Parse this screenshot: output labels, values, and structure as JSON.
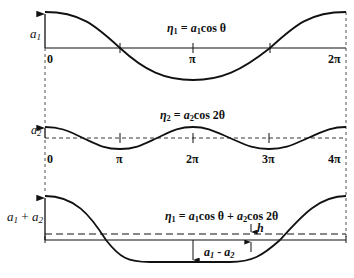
{
  "figure": {
    "stroke_color": "#111111",
    "background": "#ffffff"
  },
  "panels": [
    {
      "id": "panel-1",
      "equation": "η₁ = a₁cos θ",
      "eq_parts": {
        "eta": "η",
        "eta_sub": "1",
        "eq": " = ",
        "a": "a",
        "a_sub": "1",
        "rest": "cos θ"
      },
      "amplitude_label": {
        "a": "a",
        "sub": "1"
      },
      "x_ticks": [
        "0",
        "π",
        "2π"
      ]
    },
    {
      "id": "panel-2",
      "equation": "η₂ = a₂cos 2θ",
      "eq_parts": {
        "eta": "η",
        "eta_sub": "2",
        "eq": " = ",
        "a": "a",
        "a_sub": "2",
        "rest": "cos 2θ"
      },
      "amplitude_label": {
        "a": "a",
        "sub": "2"
      },
      "x_ticks": [
        "0",
        "π",
        "2π",
        "3π",
        "4π"
      ]
    },
    {
      "id": "panel-3",
      "equation": "η₁ = a₁cos θ + a₂cos 2θ",
      "eq_parts": {
        "eta": "η",
        "eta_sub": "1",
        "eq": " = ",
        "a1": "a",
        "a1_sub": "1",
        "mid": "cos θ + ",
        "a2": "a",
        "a2_sub": "2",
        "rest": "cos 2θ"
      },
      "amplitude_label": {
        "a1": "a",
        "a1_sub": "1",
        "plus": " + ",
        "a2": "a",
        "a2_sub": "2"
      },
      "trough_label": {
        "a1": "a",
        "a1_sub": "1",
        "minus": " - ",
        "a2": "a",
        "a2_sub": "2"
      },
      "offset_label": "h"
    }
  ]
}
